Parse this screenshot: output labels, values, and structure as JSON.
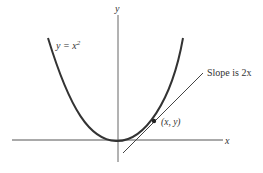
{
  "diagram": {
    "curve_label": {
      "prefix": "y = x",
      "exponent": "2"
    },
    "tangent_label": "Slope is 2x",
    "point_label": "(x, y)",
    "x_axis_label": "x",
    "y_axis_label": "y",
    "colors": {
      "curve": "#333333",
      "axes": "#555555",
      "tangent": "#444444"
    }
  }
}
